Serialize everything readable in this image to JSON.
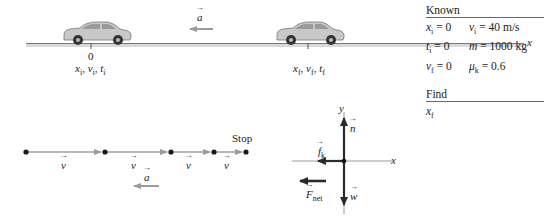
{
  "figure": {
    "top_scene": {
      "axis_label": "x",
      "acceleration_label": "a",
      "origin_tick_label": "0",
      "start_labels": "x_i, v_i, t_i",
      "end_labels": "x_f, v_f, t_f",
      "car_color": "#bfbfbf",
      "road_color": "#8c8c8c"
    },
    "known_table": {
      "title": "Known",
      "rows": [
        {
          "left": "x_i = 0",
          "right": "v_i = 40 m/s"
        },
        {
          "left": "t_i = 0",
          "right": "m = 1000 kg"
        },
        {
          "left": "v_f = 0",
          "right": "μ_k = 0.6"
        }
      ],
      "find_title": "Find",
      "find_value": "x_f"
    },
    "motion_diagram": {
      "dot_positions_px": [
        26,
        105,
        171,
        214,
        246
      ],
      "velocity_label": "v",
      "stop_label": "Stop",
      "acceleration_label": "a",
      "arrow_color": "#a0a0a0",
      "dot_color": "#1a1a1a"
    },
    "free_body_diagram": {
      "y_axis_label": "y",
      "x_axis_label": "x",
      "forces": [
        {
          "name": "n",
          "label": "n",
          "direction": "up"
        },
        {
          "name": "f_k",
          "label": "f_k",
          "direction": "left"
        },
        {
          "name": "w",
          "label": "w",
          "direction": "down"
        }
      ],
      "net_force_label": "F_net",
      "net_force_direction": "left",
      "force_color": "#333333"
    }
  },
  "text": {
    "x_axis": "x",
    "a": "a",
    "zero": "0",
    "known": "Known",
    "find": "Find",
    "stop": "Stop",
    "v": "v",
    "y": "y",
    "n": "n",
    "w": "w",
    "f": "f",
    "k": "k",
    "F": "F",
    "net": "net",
    "xi_sym": "x",
    "i": "i",
    "f_sub": "f",
    "vi_sym": "v",
    "ti_sym": "t",
    "row1_left_rest": " = 0",
    "row1_right_rest": " = 40 m/s",
    "row2_left_rest": " = 0",
    "row2_right_sym": "m",
    "row2_right_rest": " = 1000 kg",
    "row3_left_rest": " = 0",
    "row3_right_sym": "μ",
    "row3_right_rest": " = 0.6",
    "comma": ", "
  }
}
